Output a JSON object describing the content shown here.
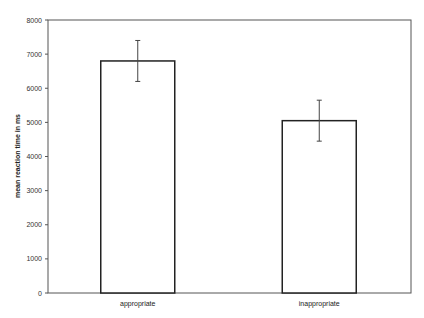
{
  "chart_data": {
    "type": "bar",
    "title": "",
    "xlabel": "",
    "ylabel": "mean reaction time in ms",
    "categories": [
      "appropriate",
      "inappropriate"
    ],
    "values": [
      6800,
      5050
    ],
    "error_bars": [
      {
        "low": 6200,
        "high": 7400
      },
      {
        "low": 4450,
        "high": 5650
      }
    ],
    "ylim": [
      0,
      8000
    ],
    "yticks": [
      0,
      1000,
      2000,
      3000,
      4000,
      5000,
      6000,
      7000,
      8000
    ],
    "grid": false,
    "legend": null,
    "bar_fill": "#ffffff",
    "bar_stroke": "#222222"
  }
}
